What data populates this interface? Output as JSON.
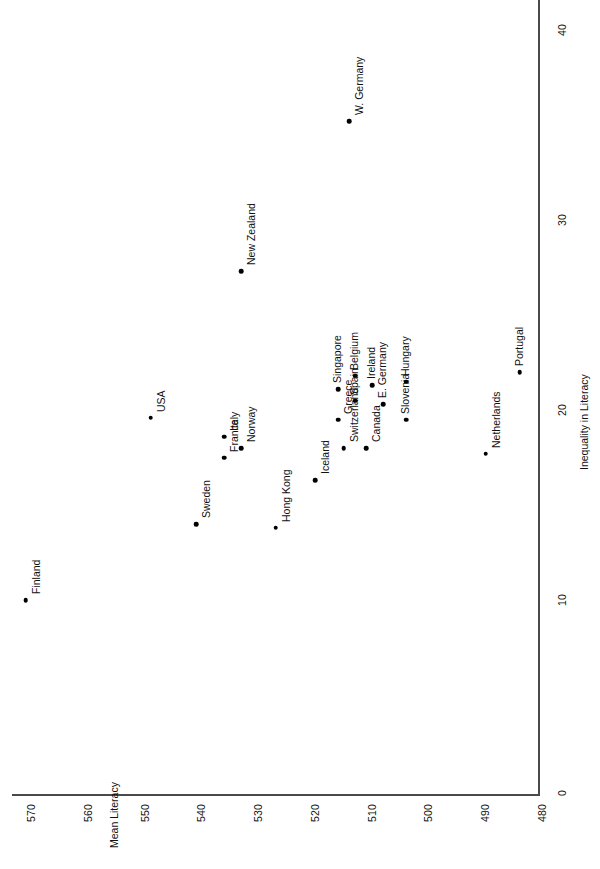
{
  "chart_data": {
    "type": "scatter",
    "title": "",
    "xlabel": "Inequality in Literacy",
    "ylabel": "Mean Literacy",
    "xlim": [
      0,
      40
    ],
    "ylim": [
      480,
      570
    ],
    "xticks": [
      "0",
      "10",
      "20",
      "30",
      "40"
    ],
    "yticks": [
      "480",
      "490",
      "500",
      "510",
      "520",
      "530",
      "540",
      "550",
      "560",
      "570"
    ],
    "grid": false,
    "legend": "none",
    "orientation": "rotated-90-ccw",
    "points": [
      {
        "label": "Finland",
        "inequality": 10.0,
        "literacy": 569
      },
      {
        "label": "USA",
        "inequality": 19.6,
        "literacy": 547
      },
      {
        "label": "Sweden",
        "inequality": 14.0,
        "literacy": 539
      },
      {
        "label": "Italy",
        "inequality": 18.6,
        "literacy": 534
      },
      {
        "label": "France",
        "inequality": 17.5,
        "literacy": 534
      },
      {
        "label": "Norway",
        "inequality": 18.0,
        "literacy": 531
      },
      {
        "label": "New Zealand",
        "inequality": 27.3,
        "literacy": 531
      },
      {
        "label": "Hong Kong",
        "inequality": 13.8,
        "literacy": 525
      },
      {
        "label": "Iceland",
        "inequality": 16.3,
        "literacy": 518
      },
      {
        "label": "Singapore",
        "inequality": 21.1,
        "literacy": 514
      },
      {
        "label": "Greece",
        "inequality": 19.5,
        "literacy": 514
      },
      {
        "label": "Switzerland",
        "inequality": 18.0,
        "literacy": 513
      },
      {
        "label": "Belgium",
        "inequality": 21.8,
        "literacy": 511
      },
      {
        "label": "Spain",
        "inequality": 20.5,
        "literacy": 511
      },
      {
        "label": "W. Germany",
        "inequality": 35.2,
        "literacy": 512
      },
      {
        "label": "Canada",
        "inequality": 18.0,
        "literacy": 509
      },
      {
        "label": "Ireland",
        "inequality": 21.3,
        "literacy": 508
      },
      {
        "label": "E. Germany",
        "inequality": 20.3,
        "literacy": 506
      },
      {
        "label": "Hungary",
        "inequality": 21.5,
        "literacy": 502
      },
      {
        "label": "Slovenia",
        "inequality": 19.5,
        "literacy": 502
      },
      {
        "label": "Netherlands",
        "inequality": 17.7,
        "literacy": 488
      },
      {
        "label": "Portugal",
        "inequality": 22.0,
        "literacy": 482
      }
    ]
  },
  "axes": {
    "literacy_title": "Mean Literacy",
    "inequality_title": "Inequality in Literacy"
  },
  "colors": {
    "point": "#000000",
    "axis": "#4a4a4a",
    "text": "#111111",
    "background": "#ffffff"
  }
}
